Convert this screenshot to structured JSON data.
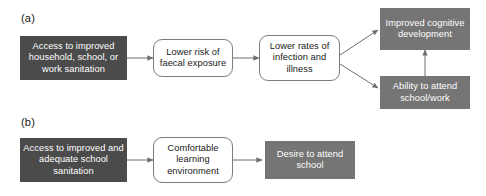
{
  "figure": {
    "background_color": "#ffffff",
    "dark_box_color": "#4b4b4b",
    "gray_box_color": "#757575",
    "outline_box_color": "#ffffff",
    "outline_border_color": "#7d7d7d",
    "arrow_color": "#6e6e6e",
    "text_light": "#ffffff",
    "text_dark": "#1a1a1a"
  },
  "panels": [
    {
      "id": "panel-a",
      "label": "(a)",
      "nodes": [
        {
          "id": "a-node-1",
          "text": "Access to improved household, school, or work sanitation",
          "style": "dark"
        },
        {
          "id": "a-node-2",
          "text": "Lower risk of faecal exposure",
          "style": "outline"
        },
        {
          "id": "a-node-3",
          "text": "Lower rates of infection and illness",
          "style": "outline"
        },
        {
          "id": "a-node-4",
          "text": "Improved cognitive development",
          "style": "gray"
        },
        {
          "id": "a-node-5",
          "text": "Ability to attend school/work",
          "style": "gray"
        }
      ],
      "edges": [
        {
          "from": "a-node-1",
          "to": "a-node-2"
        },
        {
          "from": "a-node-2",
          "to": "a-node-3"
        },
        {
          "from": "a-node-3",
          "to": "a-node-4"
        },
        {
          "from": "a-node-3",
          "to": "a-node-5"
        },
        {
          "from": "a-node-5",
          "to": "a-node-4"
        }
      ]
    },
    {
      "id": "panel-b",
      "label": "(b)",
      "nodes": [
        {
          "id": "b-node-1",
          "text": "Access to improved and adequate school sanitation",
          "style": "dark"
        },
        {
          "id": "b-node-2",
          "text": "Comfortable learning environment",
          "style": "outline"
        },
        {
          "id": "b-node-3",
          "text": "Desire to attend school",
          "style": "gray"
        }
      ],
      "edges": [
        {
          "from": "b-node-1",
          "to": "b-node-2"
        },
        {
          "from": "b-node-2",
          "to": "b-node-3"
        }
      ]
    }
  ]
}
